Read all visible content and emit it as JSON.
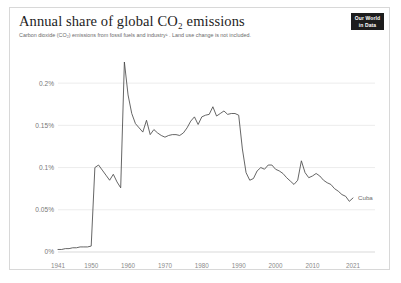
{
  "header": {
    "title": "Annual share of global CO₂ emissions",
    "subtitle": "Carbon dioxide (CO₂) emissions from fossil fuels and industry¹ . Land use change is not included.",
    "logo_line1": "Our World",
    "logo_line2": "in Data"
  },
  "chart_data": {
    "type": "line",
    "title": "Annual share of global CO₂ emissions",
    "subtitle": "Carbon dioxide (CO₂) emissions from fossil fuels and industry¹ . Land use change is not included.",
    "xlabel": "",
    "ylabel": "",
    "xlim": [
      1941,
      2021
    ],
    "ylim": [
      0,
      0.225
    ],
    "grid": true,
    "legend_position": "end-of-line",
    "y_ticks": [
      "0%",
      "0.05%",
      "0.1%",
      "0.15%",
      "0.2%"
    ],
    "y_tick_values": [
      0,
      0.05,
      0.1,
      0.15,
      0.2
    ],
    "x_ticks": [
      "1941",
      "1950",
      "1960",
      "1970",
      "1980",
      "1990",
      "2000",
      "2010",
      "2021"
    ],
    "x_tick_values": [
      1941,
      1950,
      1960,
      1970,
      1980,
      1990,
      2000,
      2010,
      2021
    ],
    "series": [
      {
        "name": "Cuba",
        "color": "#4a4a4a",
        "x": [
          1941,
          1942,
          1943,
          1944,
          1945,
          1946,
          1947,
          1948,
          1949,
          1950,
          1951,
          1952,
          1953,
          1954,
          1955,
          1956,
          1957,
          1958,
          1959,
          1960,
          1961,
          1962,
          1963,
          1964,
          1965,
          1966,
          1967,
          1968,
          1969,
          1970,
          1971,
          1972,
          1973,
          1974,
          1975,
          1976,
          1977,
          1978,
          1979,
          1980,
          1981,
          1982,
          1983,
          1984,
          1985,
          1986,
          1987,
          1988,
          1989,
          1990,
          1991,
          1992,
          1993,
          1994,
          1995,
          1996,
          1997,
          1998,
          1999,
          2000,
          2001,
          2002,
          2003,
          2004,
          2005,
          2006,
          2007,
          2008,
          2009,
          2010,
          2011,
          2012,
          2013,
          2014,
          2015,
          2016,
          2017,
          2018,
          2019,
          2020,
          2021
        ],
        "y": [
          0.003,
          0.003,
          0.004,
          0.004,
          0.005,
          0.005,
          0.006,
          0.006,
          0.006,
          0.007,
          0.1,
          0.103,
          0.097,
          0.091,
          0.085,
          0.092,
          0.083,
          0.076,
          0.225,
          0.186,
          0.164,
          0.152,
          0.147,
          0.142,
          0.156,
          0.139,
          0.145,
          0.141,
          0.138,
          0.136,
          0.138,
          0.139,
          0.139,
          0.138,
          0.141,
          0.147,
          0.155,
          0.16,
          0.151,
          0.16,
          0.162,
          0.163,
          0.172,
          0.161,
          0.164,
          0.167,
          0.163,
          0.164,
          0.164,
          0.162,
          0.122,
          0.094,
          0.085,
          0.087,
          0.096,
          0.1,
          0.098,
          0.103,
          0.103,
          0.098,
          0.096,
          0.093,
          0.088,
          0.084,
          0.08,
          0.085,
          0.108,
          0.094,
          0.088,
          0.09,
          0.093,
          0.09,
          0.085,
          0.082,
          0.08,
          0.075,
          0.072,
          0.068,
          0.066,
          0.06,
          0.064
        ]
      }
    ]
  }
}
